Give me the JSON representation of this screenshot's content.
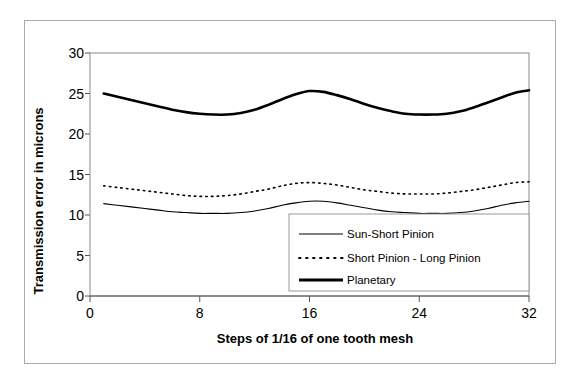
{
  "chart_data": {
    "type": "line",
    "title": "",
    "xlabel": "Steps of 1/16 of one tooth mesh",
    "ylabel": "Transmission error in microns",
    "xlim": [
      0,
      32
    ],
    "ylim": [
      0,
      30
    ],
    "xticks": [
      0,
      8,
      16,
      24,
      32
    ],
    "yticks": [
      0,
      5,
      10,
      15,
      20,
      25,
      30
    ],
    "xtick_labels": [
      "0",
      "8",
      "16",
      "24",
      "32"
    ],
    "ytick_labels": [
      "0",
      "5",
      "10",
      "15",
      "20",
      "25",
      "30"
    ],
    "grid": false,
    "legend_position": "lower-right-inside",
    "x": [
      1,
      2,
      3,
      4,
      5,
      6,
      7,
      8,
      9,
      10,
      11,
      12,
      13,
      14,
      15,
      16,
      17,
      18,
      19,
      20,
      21,
      22,
      23,
      24,
      25,
      26,
      27,
      28,
      29,
      30,
      31,
      32
    ],
    "series": [
      {
        "name": "Sun-Short Pinion",
        "style": "thin-solid",
        "stroke_width": 1.1,
        "color": "#000000",
        "values": [
          11.4,
          11.2,
          11.0,
          10.8,
          10.6,
          10.4,
          10.3,
          10.2,
          10.2,
          10.2,
          10.3,
          10.5,
          10.8,
          11.2,
          11.5,
          11.7,
          11.7,
          11.5,
          11.2,
          10.9,
          10.6,
          10.4,
          10.3,
          10.2,
          10.2,
          10.2,
          10.3,
          10.5,
          10.8,
          11.2,
          11.5,
          11.7
        ]
      },
      {
        "name": "Short Pinion - Long Pinion",
        "style": "dotted",
        "stroke_width": 1.6,
        "color": "#000000",
        "values": [
          13.6,
          13.4,
          13.2,
          13.0,
          12.8,
          12.6,
          12.4,
          12.3,
          12.3,
          12.4,
          12.6,
          12.9,
          13.2,
          13.6,
          13.9,
          14.0,
          13.9,
          13.7,
          13.4,
          13.1,
          12.9,
          12.7,
          12.6,
          12.6,
          12.6,
          12.7,
          12.9,
          13.1,
          13.4,
          13.7,
          14.0,
          14.1
        ]
      },
      {
        "name": "Planetary",
        "style": "thick-solid",
        "stroke_width": 2.6,
        "color": "#000000",
        "values": [
          25.0,
          24.6,
          24.2,
          23.8,
          23.4,
          23.0,
          22.7,
          22.5,
          22.4,
          22.4,
          22.6,
          23.0,
          23.6,
          24.3,
          24.9,
          25.3,
          25.2,
          24.8,
          24.3,
          23.7,
          23.2,
          22.8,
          22.5,
          22.4,
          22.4,
          22.5,
          22.8,
          23.3,
          23.9,
          24.5,
          25.1,
          25.4
        ]
      }
    ]
  },
  "legend": {
    "entries": [
      {
        "label": "Sun-Short Pinion",
        "swatch": "thin-solid-swatch"
      },
      {
        "label": "Short Pinion - Long Pinion",
        "swatch": "dotted-swatch"
      },
      {
        "label": "Planetary",
        "swatch": "thick-solid-swatch"
      }
    ]
  },
  "colors": {
    "ink": "#000000",
    "axis": "#555555",
    "frame": "#aaaaaa",
    "plot_border": "#888888",
    "background": "#ffffff"
  }
}
